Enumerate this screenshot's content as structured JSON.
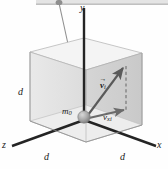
{
  "figure": {
    "type": "physics-diagram",
    "colors": {
      "axis": "#1f1f1f",
      "string": "#8a8a8a",
      "box_face_left": "#e0e0e0",
      "box_face_right": "#d2d2d2",
      "box_face_top": "#f2f2f2",
      "box_floor": "#eeeeee",
      "vector": "#5a5a5a",
      "ball": "#a8a8a8",
      "ceiling": "#cfcfcf",
      "background": "#fefefe"
    },
    "labels": {
      "axis_y": "y",
      "axis_x": "x",
      "axis_z": "z",
      "edge_d_left": "d",
      "edge_d_front_left": "d",
      "edge_d_front_right": "d",
      "mass": "m",
      "mass_sub": "0",
      "velocity_vector": "v",
      "velocity_vector_sub": "i",
      "velocity_horizontal": "v",
      "velocity_horizontal_sub": "xi",
      "vector_overbar": "→"
    }
  }
}
